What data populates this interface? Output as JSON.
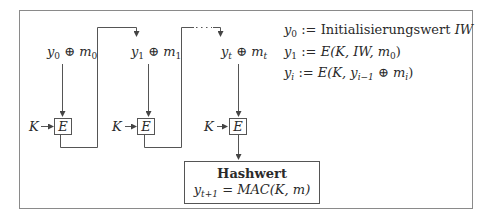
{
  "diagram": {
    "type": "CBC-MAC chain",
    "stages": [
      {
        "y_var": "y",
        "y_sub": "0",
        "op": "⊕",
        "m_var": "m",
        "m_sub": "0",
        "key": "K",
        "block": "E"
      },
      {
        "y_var": "y",
        "y_sub": "1",
        "op": "⊕",
        "m_var": "m",
        "m_sub": "1",
        "key": "K",
        "block": "E"
      },
      {
        "y_var": "y",
        "y_sub": "t",
        "op": "⊕",
        "m_var": "m",
        "m_sub": "t",
        "key": "K",
        "block": "E"
      }
    ],
    "ellipsis": "· · ·",
    "output": {
      "title": "Hashwert",
      "lhs_var": "y",
      "lhs_sub": "t+1",
      "rhs": "= MAC(K, m)"
    },
    "definitions": [
      {
        "var": "y",
        "sub": "0",
        "assign": " := ",
        "text": "Initialisierungswert ",
        "text_it": "IW"
      },
      {
        "var": "y",
        "sub": "1",
        "assign": " := ",
        "text": "",
        "text_it": "E(K, IW, m",
        "tail_sub": "0",
        "tail": ")"
      },
      {
        "var": "y",
        "sub": "i",
        "assign": " := ",
        "text": "",
        "text_it": "E(K, y",
        "tail_sub": "i−1",
        "tail": " ⊕ m",
        "tail_sub2": "i",
        "tail2": ")"
      }
    ]
  },
  "colors": {
    "line": "#555555",
    "text": "#2a2a2a",
    "frame": "#8a8a8a"
  }
}
